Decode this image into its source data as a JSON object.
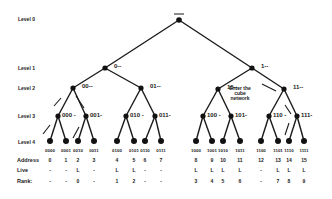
{
  "levels": [
    {
      "label": "Level 0",
      "y": 19
    },
    {
      "label": "Level 1",
      "y": 68
    },
    {
      "label": "Level 2",
      "y": 88
    },
    {
      "label": "Level 3",
      "y": 116
    },
    {
      "label": "Level 4",
      "y": 142
    }
  ],
  "root": {
    "label": "—",
    "x": 179,
    "y": 20
  },
  "level1_nodes": [
    {
      "label": "0--",
      "x": 105,
      "y": 68
    },
    {
      "label": "1--",
      "x": 252,
      "y": 68
    }
  ],
  "level2_nodes": [
    {
      "label": "00--",
      "x": 73,
      "y": 88
    },
    {
      "label": "01--",
      "x": 141,
      "y": 88
    },
    {
      "label": "10--",
      "x": 218,
      "y": 89
    },
    {
      "label": "11--",
      "x": 284,
      "y": 89
    }
  ],
  "level3_nodes": [
    {
      "label": "000 -",
      "x": 58,
      "y": 116
    },
    {
      "label": "001-",
      "x": 86,
      "y": 116
    },
    {
      "label": "010 -",
      "x": 126,
      "y": 116
    },
    {
      "label": "011-",
      "x": 155,
      "y": 116
    },
    {
      "label": "100 -",
      "x": 203,
      "y": 116
    },
    {
      "label": "101-",
      "x": 231,
      "y": 116
    },
    {
      "label": "110 -",
      "x": 269,
      "y": 116
    },
    {
      "label": "111-",
      "x": 297,
      "y": 116
    }
  ],
  "annotation": {
    "line1": "Enter the",
    "line2": "cube",
    "line3": "network"
  },
  "table": {
    "row_labels": {
      "address": "Address",
      "live": "Live",
      "rank": "Rank:"
    },
    "leaves": [
      {
        "bits": "0000",
        "address": "0",
        "live": "-",
        "rank": "-",
        "x": 50
      },
      {
        "bits": "0001",
        "address": "1",
        "live": "-",
        "rank": "-",
        "x": 66
      },
      {
        "bits": "0010",
        "address": "2",
        "live": "L",
        "rank": "0",
        "x": 78
      },
      {
        "bits": "0011",
        "address": "3",
        "live": "-",
        "rank": "-",
        "x": 94
      },
      {
        "bits": "0100",
        "address": "4",
        "live": "L",
        "rank": "1",
        "x": 117
      },
      {
        "bits": "0101",
        "address": "5",
        "live": "L",
        "rank": "2",
        "x": 134
      },
      {
        "bits": "0110",
        "address": "6",
        "live": "-",
        "rank": "-",
        "x": 145
      },
      {
        "bits": "0111",
        "address": "7",
        "live": "-",
        "rank": "-",
        "x": 161
      },
      {
        "bits": "1000",
        "address": "8",
        "live": "L",
        "rank": "3",
        "x": 196
      },
      {
        "bits": "1001",
        "address": "9",
        "live": "L",
        "rank": "4",
        "x": 212
      },
      {
        "bits": "1010",
        "address": "10",
        "live": "L",
        "rank": "5",
        "x": 223
      },
      {
        "bits": "1011",
        "address": "11",
        "live": "L",
        "rank": "6",
        "x": 240
      },
      {
        "bits": "1100",
        "address": "12",
        "live": "-",
        "rank": "-",
        "x": 261
      },
      {
        "bits": "1101",
        "address": "13",
        "live": "L",
        "rank": "7",
        "x": 278
      },
      {
        "bits": "1110",
        "address": "14",
        "live": "L",
        "rank": "8",
        "x": 289
      },
      {
        "bits": "1111",
        "address": "15",
        "live": "L",
        "rank": "9",
        "x": 304
      }
    ]
  },
  "colors": {
    "line": "#1a1a1a",
    "node": "#111111",
    "background": "#ffffff"
  }
}
